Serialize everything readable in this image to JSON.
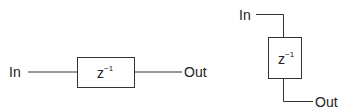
{
  "diagrams": [
    {
      "orientation": "horizontal",
      "input_label": "In",
      "output_label": "Out",
      "block": {
        "base": "z",
        "exponent": "−1"
      }
    },
    {
      "orientation": "vertical",
      "input_label": "In",
      "output_label": "Out",
      "block": {
        "base": "z",
        "exponent": "−1"
      }
    }
  ],
  "colors": {
    "stroke": "#333333",
    "text": "#222222",
    "background": "#ffffff"
  }
}
